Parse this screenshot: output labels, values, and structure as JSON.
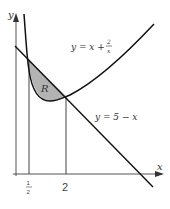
{
  "diagram": {
    "axes": {
      "x_label": "x",
      "y_label": "y"
    },
    "curves": [
      {
        "name": "curve",
        "label_y": "y = x + ",
        "label_frac_num": "2",
        "label_frac_den": "x"
      },
      {
        "name": "line",
        "label": "y = 5 − x"
      }
    ],
    "region_label": "R",
    "ticks": [
      {
        "num": "1",
        "den": "2"
      },
      {
        "label": "2"
      }
    ],
    "colors": {
      "curve": "#111111",
      "region": "#b0b0b0"
    }
  }
}
